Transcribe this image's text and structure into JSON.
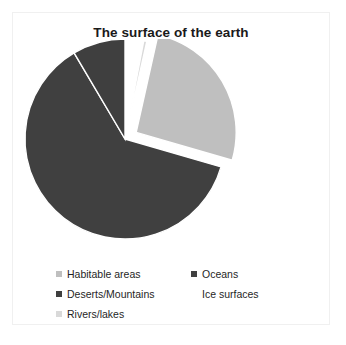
{
  "chart_data": {
    "type": "pie",
    "title": "The surface of the earth",
    "xlabel": "",
    "ylabel": "",
    "legend_position": "bottom",
    "grid": false,
    "exploded_slice": "Habitable areas",
    "categories": [
      "Ice surfaces",
      "Rivers/lakes",
      "Habitable areas",
      "Oceans",
      "Deserts/Mountains"
    ],
    "values": [
      3,
      0.5,
      26,
      62,
      8.5
    ],
    "colors": [
      "#ffffff",
      "#d9d9d9",
      "#bfbfbf",
      "#404040",
      "#3f3f3f"
    ],
    "slices": [
      {
        "label": "Ice surfaces",
        "value": 3,
        "color": "#ffffff",
        "start_angle": 0,
        "end_angle": 10.8,
        "exploded": false
      },
      {
        "label": "Rivers/lakes",
        "value": 0.5,
        "color": "#d9d9d9",
        "start_angle": 10.8,
        "end_angle": 12.6,
        "exploded": false
      },
      {
        "label": "Habitable areas",
        "value": 26,
        "color": "#bfbfbf",
        "start_angle": 12.6,
        "end_angle": 106.2,
        "exploded": true
      },
      {
        "label": "Oceans",
        "value": 62,
        "color": "#404040",
        "start_angle": 106.2,
        "end_angle": 329.4,
        "exploded": false
      },
      {
        "label": "Deserts/Mountains",
        "value": 8.5,
        "color": "#3f3f3f",
        "start_angle": 329.4,
        "end_angle": 360,
        "exploded": false
      }
    ]
  },
  "chart": {
    "title": "The surface of the earth"
  },
  "legend": {
    "entries": [
      {
        "label": "Habitable areas",
        "color": "#bfbfbf",
        "blank": false
      },
      {
        "label": "Oceans",
        "color": "#404040",
        "blank": false
      },
      {
        "label": "Deserts/Mountains",
        "color": "#3f3f3f",
        "blank": false
      },
      {
        "label": "Ice surfaces",
        "color": "#ffffff",
        "blank": true
      },
      {
        "label": "Rivers/lakes",
        "color": "#d9d9d9",
        "blank": false
      }
    ]
  }
}
